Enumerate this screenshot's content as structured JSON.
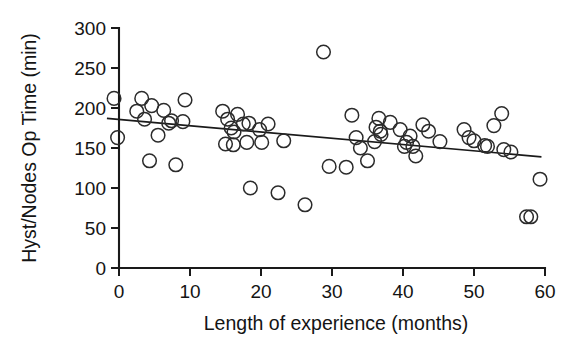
{
  "chart_data": {
    "type": "scatter",
    "title": "",
    "subtitle": "",
    "xlabel": "Length of experience (months)",
    "ylabel": "Hyst/Nodes Op Time (min)",
    "xlim": [
      -2.5,
      61
    ],
    "ylim": [
      0,
      300
    ],
    "xticks": [
      0,
      10,
      20,
      30,
      40,
      50,
      60
    ],
    "yticks": [
      0,
      50,
      100,
      150,
      200,
      250,
      300
    ],
    "xticklabels": [
      "0",
      "10",
      "20",
      "30",
      "40",
      "50",
      "60"
    ],
    "yticklabels": [
      "0",
      "50",
      "100",
      "150",
      "200",
      "250",
      "300"
    ],
    "grid": false,
    "legend": null,
    "marker": "open-circle",
    "marker_size": 7,
    "series": [
      {
        "name": "Hysterectomy / node dissection cases",
        "points": [
          [
            -0.7,
            212
          ],
          [
            -0.2,
            163
          ],
          [
            2.5,
            196
          ],
          [
            3.2,
            212
          ],
          [
            3.6,
            186
          ],
          [
            4.6,
            203
          ],
          [
            4.3,
            134
          ],
          [
            5.5,
            166
          ],
          [
            6.3,
            197
          ],
          [
            7.0,
            181
          ],
          [
            7.4,
            184
          ],
          [
            8.0,
            129
          ],
          [
            9.3,
            210
          ],
          [
            9.0,
            183
          ],
          [
            14.6,
            196
          ],
          [
            15.3,
            186
          ],
          [
            15.8,
            175
          ],
          [
            16.2,
            170
          ],
          [
            15.0,
            155
          ],
          [
            16.1,
            154
          ],
          [
            17.5,
            180
          ],
          [
            16.7,
            192
          ],
          [
            18.3,
            181
          ],
          [
            18.0,
            157
          ],
          [
            18.5,
            100
          ],
          [
            19.8,
            173
          ],
          [
            20.1,
            157
          ],
          [
            21.0,
            180
          ],
          [
            22.4,
            94
          ],
          [
            23.2,
            159
          ],
          [
            26.2,
            79
          ],
          [
            28.8,
            270
          ],
          [
            29.6,
            127
          ],
          [
            32.0,
            126
          ],
          [
            32.8,
            191
          ],
          [
            33.4,
            163
          ],
          [
            34.0,
            150
          ],
          [
            35.0,
            134
          ],
          [
            36.0,
            158
          ],
          [
            36.6,
            187
          ],
          [
            36.2,
            176
          ],
          [
            36.8,
            171
          ],
          [
            36.9,
            167
          ],
          [
            38.2,
            182
          ],
          [
            39.6,
            173
          ],
          [
            40.5,
            157
          ],
          [
            40.2,
            152
          ],
          [
            41.0,
            165
          ],
          [
            41.4,
            152
          ],
          [
            41.8,
            140
          ],
          [
            42.8,
            179
          ],
          [
            43.6,
            171
          ],
          [
            45.2,
            158
          ],
          [
            48.6,
            173
          ],
          [
            49.3,
            163
          ],
          [
            50.0,
            159
          ],
          [
            51.5,
            153
          ],
          [
            51.9,
            152
          ],
          [
            52.8,
            178
          ],
          [
            53.9,
            193
          ],
          [
            54.2,
            148
          ],
          [
            55.2,
            145
          ],
          [
            57.4,
            64
          ],
          [
            58.0,
            64
          ],
          [
            59.3,
            111
          ]
        ]
      }
    ],
    "fit_line": {
      "name": "linear regression",
      "x_start": -1.7,
      "y_start": 187,
      "x_end": 59.5,
      "y_end": 139
    }
  },
  "axes": {
    "y_axis_label": "Hyst/Nodes Op Time (min)",
    "x_axis_label": "Length of experience (months)"
  }
}
